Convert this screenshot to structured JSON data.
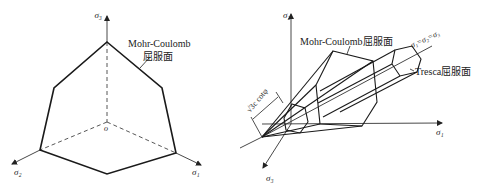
{
  "left_figure": {
    "axes": {
      "sigma3": "σ₃",
      "sigma2": "σ₂",
      "sigma1": "σ₁",
      "origin": "o"
    },
    "label_line1": "Mohr-Coulomb",
    "label_line2": "屈服面"
  },
  "right_figure": {
    "axes": {
      "sigma2": "σ₂",
      "sigma1": "σ₁",
      "sigma3": "σ₃"
    },
    "mohr_label": "Mohr-Coulomb屈服面",
    "tresca_label": "Tresca屈服面",
    "hydrostatic_axis_label": "σ₁=σ₂=σ₃",
    "dimension_label": "√3c cotφ"
  },
  "colors": {
    "line": "#1a1a1a",
    "background": "#ffffff"
  }
}
